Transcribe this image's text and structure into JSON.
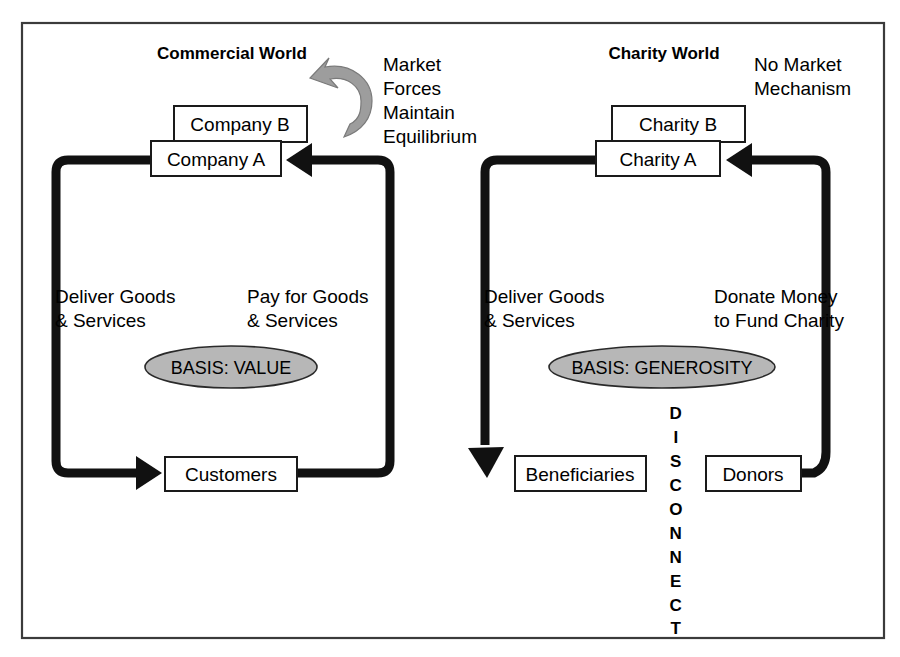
{
  "figure": {
    "kind": "two-panel-flow-diagram",
    "frame": {
      "border_color": "#3b3b3b"
    }
  },
  "panels": [
    {
      "id": "commercial",
      "heading": "Commercial World",
      "nodes": {
        "back_box": "Company B",
        "front_box": "Company A",
        "bottom_box": "Customers"
      },
      "edge_labels": {
        "left": {
          "line1": "Deliver Goods",
          "line2": "& Services"
        },
        "right": {
          "line1": "Pay for Goods",
          "line2": "& Services"
        }
      },
      "annotation": {
        "icon": "curved-arrow-icon",
        "lines": [
          "Market",
          "Forces",
          "Maintain",
          "Equilibrium"
        ]
      },
      "basis_badge": {
        "label": "BASIS: VALUE",
        "fill": "#b7b7b7"
      }
    },
    {
      "id": "charity",
      "heading": "Charity World",
      "nodes": {
        "back_box": "Charity B",
        "front_box": "Charity A",
        "bottom_left_box": "Beneficiaries",
        "bottom_right_box": "Donors"
      },
      "edge_labels": {
        "left": {
          "line1": "Deliver Goods",
          "line2": "& Services"
        },
        "right": {
          "line1": "Donate Money",
          "line2": "to Fund Charity"
        }
      },
      "annotation": {
        "lines": [
          "No Market",
          "Mechanism"
        ]
      },
      "basis_badge": {
        "label": "BASIS: GENEROSITY",
        "fill": "#b7b7b7"
      },
      "disconnect": {
        "text": "DISCONNECT",
        "letters": [
          "D",
          "I",
          "S",
          "C",
          "O",
          "N",
          "N",
          "E",
          "C",
          "T"
        ]
      }
    }
  ]
}
